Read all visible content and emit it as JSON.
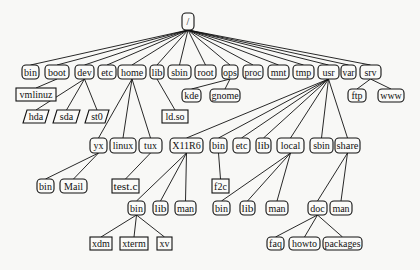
{
  "diagram": {
    "type": "tree",
    "colors": {
      "stroke": "#111111",
      "fill": "#fafaf8",
      "background": "#f8f8f6"
    },
    "nodes": [
      {
        "id": "root",
        "label": "/",
        "shape": "rounded",
        "x": 182,
        "y": 13,
        "w": 12,
        "h": 17,
        "parent": null
      },
      {
        "id": "bin",
        "label": "bin",
        "shape": "rounded",
        "x": 22,
        "y": 65,
        "w": 17,
        "h": 14,
        "parent": "root"
      },
      {
        "id": "boot",
        "label": "boot",
        "shape": "rounded",
        "x": 45,
        "y": 65,
        "w": 24,
        "h": 14,
        "parent": "root"
      },
      {
        "id": "dev",
        "label": "dev",
        "shape": "rounded",
        "x": 75,
        "y": 65,
        "w": 19,
        "h": 14,
        "parent": "root"
      },
      {
        "id": "etc",
        "label": "etc",
        "shape": "rounded",
        "x": 98,
        "y": 65,
        "w": 18,
        "h": 14,
        "parent": "root"
      },
      {
        "id": "home",
        "label": "home",
        "shape": "rounded",
        "x": 118,
        "y": 65,
        "w": 28,
        "h": 14,
        "parent": "root"
      },
      {
        "id": "lib",
        "label": "lib",
        "shape": "rounded",
        "x": 150,
        "y": 65,
        "w": 14,
        "h": 14,
        "parent": "root"
      },
      {
        "id": "sbin",
        "label": "sbin",
        "shape": "rounded",
        "x": 168,
        "y": 65,
        "w": 23,
        "h": 14,
        "parent": "root"
      },
      {
        "id": "rootdir",
        "label": "root",
        "shape": "rounded",
        "x": 195,
        "y": 65,
        "w": 21,
        "h": 14,
        "parent": "root"
      },
      {
        "id": "ops",
        "label": "ops",
        "shape": "rounded",
        "x": 222,
        "y": 65,
        "w": 16,
        "h": 14,
        "parent": "root"
      },
      {
        "id": "proc",
        "label": "proc",
        "shape": "rounded",
        "x": 243,
        "y": 65,
        "w": 20,
        "h": 14,
        "parent": "root"
      },
      {
        "id": "mnt",
        "label": "mnt",
        "shape": "rounded",
        "x": 268,
        "y": 65,
        "w": 21,
        "h": 14,
        "parent": "root"
      },
      {
        "id": "tmp",
        "label": "tmp",
        "shape": "rounded",
        "x": 293,
        "y": 65,
        "w": 21,
        "h": 14,
        "parent": "root"
      },
      {
        "id": "usr",
        "label": "usr",
        "shape": "rounded",
        "x": 318,
        "y": 65,
        "w": 21,
        "h": 14,
        "parent": "root"
      },
      {
        "id": "var",
        "label": "var",
        "shape": "rounded",
        "x": 341,
        "y": 65,
        "w": 15,
        "h": 14,
        "parent": "root"
      },
      {
        "id": "srv",
        "label": "srv",
        "shape": "rounded",
        "x": 360,
        "y": 65,
        "w": 21,
        "h": 14,
        "parent": "root"
      },
      {
        "id": "vmlinuz",
        "label": "vmlinuz",
        "shape": "rect",
        "x": 16,
        "y": 88,
        "w": 40,
        "h": 13,
        "parent": "boot"
      },
      {
        "id": "hda",
        "label": "hda",
        "shape": "parallelogram",
        "x": 23,
        "y": 110,
        "w": 26,
        "h": 13,
        "parent": "dev"
      },
      {
        "id": "sda",
        "label": "sda",
        "shape": "parallelogram",
        "x": 53,
        "y": 110,
        "w": 27,
        "h": 13,
        "parent": "dev"
      },
      {
        "id": "st0",
        "label": "st0",
        "shape": "parallelogram",
        "x": 85,
        "y": 110,
        "w": 24,
        "h": 13,
        "parent": "dev"
      },
      {
        "id": "ldso",
        "label": "ld.so",
        "shape": "rect",
        "x": 162,
        "y": 110,
        "w": 26,
        "h": 13,
        "parent": "lib"
      },
      {
        "id": "kde",
        "label": "kde",
        "shape": "rounded",
        "x": 182,
        "y": 89,
        "w": 19,
        "h": 13,
        "parent": "ops"
      },
      {
        "id": "gnome",
        "label": "gnome",
        "shape": "rounded",
        "x": 210,
        "y": 89,
        "w": 30,
        "h": 13,
        "parent": "ops"
      },
      {
        "id": "ftp",
        "label": "ftp",
        "shape": "rounded",
        "x": 348,
        "y": 89,
        "w": 18,
        "h": 13,
        "parent": "srv"
      },
      {
        "id": "www",
        "label": "www",
        "shape": "rounded",
        "x": 378,
        "y": 89,
        "w": 26,
        "h": 13,
        "parent": "srv"
      },
      {
        "id": "yx",
        "label": "yx",
        "shape": "rounded",
        "x": 90,
        "y": 138,
        "w": 17,
        "h": 15,
        "parent": "home"
      },
      {
        "id": "linux",
        "label": "linux",
        "shape": "rounded",
        "x": 110,
        "y": 138,
        "w": 26,
        "h": 15,
        "parent": "home"
      },
      {
        "id": "tux",
        "label": "tux",
        "shape": "rounded",
        "x": 139,
        "y": 138,
        "w": 23,
        "h": 15,
        "parent": "home"
      },
      {
        "id": "x11r6",
        "label": "X11R6",
        "shape": "rounded",
        "x": 170,
        "y": 138,
        "w": 33,
        "h": 15,
        "parent": "usr"
      },
      {
        "id": "usr_bin",
        "label": "bin",
        "shape": "rounded",
        "x": 210,
        "y": 138,
        "w": 17,
        "h": 15,
        "parent": "usr"
      },
      {
        "id": "usr_etc",
        "label": "etc",
        "shape": "rounded",
        "x": 233,
        "y": 138,
        "w": 17,
        "h": 15,
        "parent": "usr"
      },
      {
        "id": "usr_lib",
        "label": "lib",
        "shape": "rounded",
        "x": 256,
        "y": 138,
        "w": 15,
        "h": 15,
        "parent": "usr"
      },
      {
        "id": "local",
        "label": "local",
        "shape": "rounded",
        "x": 277,
        "y": 138,
        "w": 27,
        "h": 15,
        "parent": "usr"
      },
      {
        "id": "usr_sbin",
        "label": "sbin",
        "shape": "rounded",
        "x": 310,
        "y": 138,
        "w": 23,
        "h": 15,
        "parent": "usr"
      },
      {
        "id": "share",
        "label": "share",
        "shape": "rounded",
        "x": 335,
        "y": 138,
        "w": 25,
        "h": 15,
        "parent": "usr"
      },
      {
        "id": "yx_bin",
        "label": "bin",
        "shape": "rounded",
        "x": 37,
        "y": 179,
        "w": 17,
        "h": 14,
        "parent": "yx"
      },
      {
        "id": "mail",
        "label": "Mail",
        "shape": "rounded",
        "x": 60,
        "y": 179,
        "w": 27,
        "h": 14,
        "parent": "yx"
      },
      {
        "id": "testc",
        "label": "test.c",
        "shape": "rect",
        "x": 112,
        "y": 179,
        "w": 27,
        "h": 14,
        "parent": "tux"
      },
      {
        "id": "f2c",
        "label": "f2c",
        "shape": "rect",
        "x": 212,
        "y": 179,
        "w": 17,
        "h": 14,
        "parent": "usr_bin"
      },
      {
        "id": "x_bin",
        "label": "bin",
        "shape": "rounded",
        "x": 128,
        "y": 201,
        "w": 17,
        "h": 14,
        "parent": "x11r6"
      },
      {
        "id": "x_lib",
        "label": "lib",
        "shape": "rounded",
        "x": 153,
        "y": 201,
        "w": 15,
        "h": 14,
        "parent": "x11r6"
      },
      {
        "id": "x_man",
        "label": "man",
        "shape": "rounded",
        "x": 175,
        "y": 201,
        "w": 21,
        "h": 14,
        "parent": "x11r6"
      },
      {
        "id": "l_bin",
        "label": "bin",
        "shape": "rounded",
        "x": 213,
        "y": 201,
        "w": 17,
        "h": 14,
        "parent": "local"
      },
      {
        "id": "l_lib",
        "label": "lib",
        "shape": "rounded",
        "x": 240,
        "y": 201,
        "w": 15,
        "h": 14,
        "parent": "local"
      },
      {
        "id": "l_man",
        "label": "man",
        "shape": "rounded",
        "x": 266,
        "y": 201,
        "w": 22,
        "h": 14,
        "parent": "local"
      },
      {
        "id": "doc",
        "label": "doc",
        "shape": "rounded",
        "x": 308,
        "y": 201,
        "w": 19,
        "h": 14,
        "parent": "share"
      },
      {
        "id": "s_man",
        "label": "man",
        "shape": "rounded",
        "x": 330,
        "y": 201,
        "w": 22,
        "h": 14,
        "parent": "share"
      },
      {
        "id": "xdm",
        "label": "xdm",
        "shape": "rect",
        "x": 90,
        "y": 237,
        "w": 22,
        "h": 13,
        "parent": "x_bin"
      },
      {
        "id": "xterm",
        "label": "xterm",
        "shape": "rect",
        "x": 120,
        "y": 237,
        "w": 28,
        "h": 13,
        "parent": "x_bin"
      },
      {
        "id": "xv",
        "label": "xv",
        "shape": "rect",
        "x": 157,
        "y": 237,
        "w": 15,
        "h": 13,
        "parent": "x_bin"
      },
      {
        "id": "faq",
        "label": "faq",
        "shape": "rounded",
        "x": 267,
        "y": 237,
        "w": 17,
        "h": 13,
        "parent": "doc"
      },
      {
        "id": "howto",
        "label": "howto",
        "shape": "rounded",
        "x": 289,
        "y": 237,
        "w": 31,
        "h": 13,
        "parent": "doc"
      },
      {
        "id": "packages",
        "label": "packages",
        "shape": "rounded",
        "x": 323,
        "y": 237,
        "w": 39,
        "h": 13,
        "parent": "doc"
      }
    ],
    "legend": {
      "rounded": "directory",
      "rect": "file",
      "parallelogram": "device"
    }
  }
}
